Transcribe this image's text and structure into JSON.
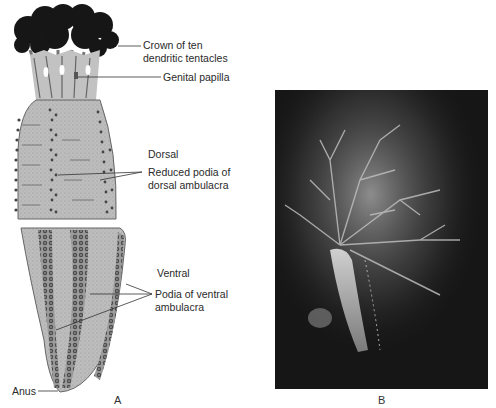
{
  "figure": {
    "panel_a": {
      "letter": "A",
      "labels": {
        "crown_line1": "Crown of ten",
        "crown_line2": "dendritic tentacles",
        "genital_papilla": "Genital papilla",
        "dorsal": "Dorsal",
        "dorsal_podia_line1": "Reduced podia of",
        "dorsal_podia_line2": "dorsal ambulacra",
        "ventral": "Ventral",
        "ventral_podia_line1": "Podia of ventral",
        "ventral_podia_line2": "ambulacra",
        "anus": "Anus"
      }
    },
    "panel_b": {
      "letter": "B"
    },
    "colors": {
      "background": "#ffffff",
      "body_fill": "#b8b8b8",
      "tentacle_fill": "#1a1a1a",
      "photo_bg": "#161616",
      "label_text": "#2a2a2a"
    }
  }
}
